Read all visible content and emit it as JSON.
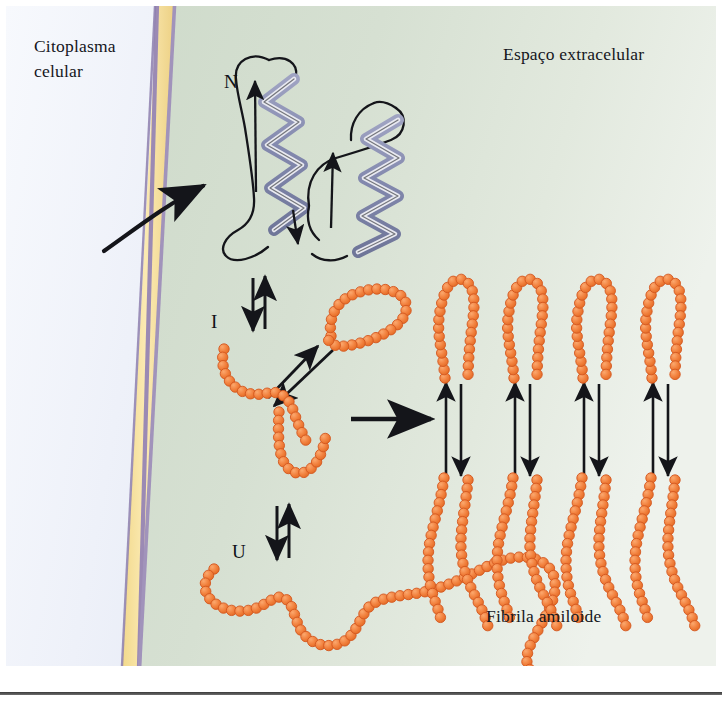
{
  "figure": {
    "title_alt": "Protein misfolding and amyloid fibril formation across the cell membrane",
    "labels": {
      "cytoplasm": "Citoplasma\ncelular",
      "extracellular": "Espaço extracelular",
      "fibril": "Fibrila amiloide",
      "native_terminus": "N",
      "intermediate": "I",
      "unfolded": "U"
    },
    "colors": {
      "cytoplasm_light": "#f7f9fd",
      "cytoplasm_dark": "#d6ddee",
      "extracellular": "#d4dfd1",
      "extracellular_light": "#e9efe7",
      "membrane_core": "#f6dd93",
      "membrane_edge": "#9b8ab4",
      "bead_fill": "#f0813f",
      "bead_edge": "#d4571f",
      "helix_fill": "#8f93b5",
      "helix_light": "#e7e8ef",
      "stroke": "#14151a",
      "text": "#15161c"
    },
    "regions": [
      {
        "name": "cytoplasm",
        "side": "left"
      },
      {
        "name": "membrane",
        "side": "center"
      },
      {
        "name": "extracellular",
        "side": "right"
      }
    ],
    "states": [
      {
        "id": "N",
        "name": "native-folded-protein",
        "description": "two alpha helices with loops"
      },
      {
        "id": "I",
        "name": "intermediate-state",
        "description": "partially folded bead chains"
      },
      {
        "id": "U",
        "name": "unfolded-state",
        "description": "extended random coil bead chain"
      }
    ],
    "fibril": {
      "units": 4,
      "description": "stacked beta hairpin protofilaments"
    },
    "arrows": {
      "membrane_transport": "curved arrow crossing membrane",
      "equilibrium_N_I": "double reversible arrow",
      "equilibrium_I_U": "double reversible arrow",
      "I_to_fibril": "straight arrow to fibril",
      "conformational_exchange": "double headed diagonal arrow"
    }
  }
}
